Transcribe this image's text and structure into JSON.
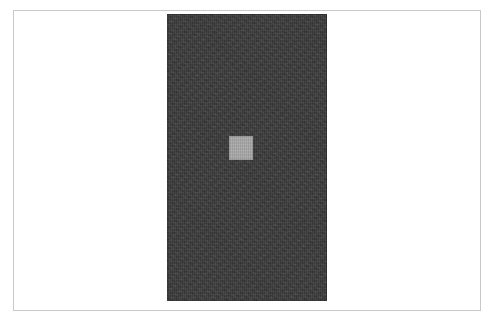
{
  "figure": {
    "background_color": "#ffffff",
    "frame": {
      "label": "figure-border",
      "border_color": "#c9c9c9",
      "border_width_px": 1,
      "x": 13,
      "y": 10,
      "width": 468,
      "height": 301
    },
    "panel": {
      "label": "dark-textured-panel",
      "fill_color": "#3b3b3b",
      "texture": "fine-grain-noise",
      "x": 167,
      "y": 14,
      "width": 160,
      "height": 287
    },
    "marker": {
      "label": "light-gray-square-marker",
      "fill_color": "#a8a8a8",
      "x": 229,
      "y": 136,
      "width": 24,
      "height": 24
    }
  },
  "canvas": {
    "width": 496,
    "height": 321
  }
}
